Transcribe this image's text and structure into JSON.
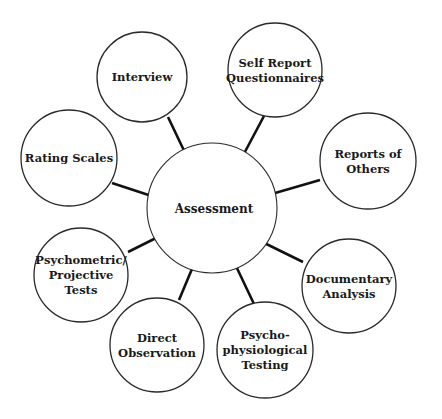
{
  "diagram": {
    "center": {
      "label": "Assessment",
      "cx": 212,
      "cy": 208,
      "r": 65
    },
    "nodes": [
      {
        "id": "interview",
        "lines": [
          "Interview"
        ],
        "cx": 142,
        "cy": 77,
        "r": 45,
        "arrow": [
          168,
          117,
          198,
          180
        ]
      },
      {
        "id": "self-report-questionnaires",
        "lines": [
          "Self Report",
          "Questionnaires"
        ],
        "cx": 275,
        "cy": 70,
        "r": 47,
        "arrow": [
          264,
          116,
          230,
          180
        ]
      },
      {
        "id": "reports-of-others",
        "lines": [
          "Reports of",
          "Others"
        ],
        "cx": 368,
        "cy": 161,
        "r": 48,
        "arrow": [
          320,
          180,
          251,
          200
        ]
      },
      {
        "id": "rating-scales",
        "lines": [
          "Rating Scales"
        ],
        "cx": 69,
        "cy": 158,
        "r": 48,
        "arrow": [
          112,
          183,
          176,
          204
        ]
      },
      {
        "id": "psychometric-projective-tests",
        "lines": [
          "Psychometric/",
          "Projective",
          "Tests"
        ],
        "cx": 81,
        "cy": 275,
        "r": 47,
        "arrow": [
          128,
          252,
          180,
          226
        ]
      },
      {
        "id": "direct-observation",
        "lines": [
          "Direct",
          "Observation"
        ],
        "cx": 157,
        "cy": 345,
        "r": 47,
        "arrow": [
          179,
          300,
          202,
          245
        ]
      },
      {
        "id": "psychophysiological-testing",
        "lines": [
          "Psycho-",
          "physiological",
          "Testing"
        ],
        "cx": 265,
        "cy": 350,
        "r": 48,
        "arrow": [
          254,
          304,
          226,
          245
        ]
      },
      {
        "id": "documentary-analysis",
        "lines": [
          "Documentary",
          "Analysis"
        ],
        "cx": 349,
        "cy": 286,
        "r": 47,
        "arrow": [
          303,
          262,
          246,
          234
        ]
      }
    ],
    "colors": {
      "stroke": "#2a2a2a",
      "arrow": "#111111",
      "text": "#1a1a1a",
      "background": "#ffffff"
    }
  }
}
